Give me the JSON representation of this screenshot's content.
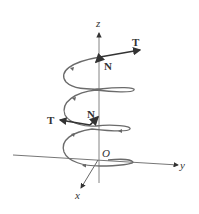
{
  "figure": {
    "axes": {
      "x": "x",
      "y": "y",
      "z": "z",
      "origin": "O"
    },
    "vectors": [
      {
        "label": "T",
        "position": "top-right"
      },
      {
        "label": "N",
        "position": "top"
      },
      {
        "label": "T",
        "position": "middle-left"
      },
      {
        "label": "N",
        "position": "middle"
      }
    ],
    "colors": {
      "curve": "#6b6b6b",
      "axis": "#555555",
      "vector": "#222222",
      "text": "#333333"
    }
  }
}
